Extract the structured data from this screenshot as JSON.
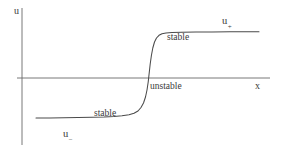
{
  "figure": {
    "background_color": "#ffffff",
    "line_color": "#4a4a4a",
    "text_color": "#3a3a3a"
  },
  "axes": {
    "y_label": "u",
    "x_label": "x",
    "y_axis": {
      "x": 22,
      "y_top": 8,
      "y_bottom": 145
    },
    "x_axis": {
      "y": 78,
      "x_left": 17,
      "x_right": 270
    },
    "ticks": [],
    "grid": false
  },
  "annotations": [
    {
      "id": "u-plus",
      "text": "u",
      "subscript": "+",
      "x": 222,
      "y": 16
    },
    {
      "id": "u-minus",
      "text": "u",
      "subscript": "−",
      "x": 63,
      "y": 129
    },
    {
      "id": "stable-upper",
      "text": "stable",
      "subscript": "",
      "x": 167,
      "y": 33
    },
    {
      "id": "unstable",
      "text": "unstable",
      "subscript": "",
      "x": 150,
      "y": 82
    },
    {
      "id": "stable-lower",
      "text": "stable",
      "subscript": "",
      "x": 94,
      "y": 109
    }
  ],
  "chart_data": {
    "type": "line",
    "title": "",
    "xlabel": "x",
    "ylabel": "u",
    "grid": false,
    "legend": null,
    "xlim": [
      17,
      270
    ],
    "ylim_pixels": [
      32,
      118
    ],
    "series": [
      {
        "name": "front profile u(x)",
        "stroke": "#4a4a4a",
        "points": [
          [
            36,
            118
          ],
          [
            50,
            118
          ],
          [
            64,
            117.8
          ],
          [
            78,
            117.6
          ],
          [
            92,
            117.3
          ],
          [
            104,
            117.0
          ],
          [
            114,
            116.5
          ],
          [
            122,
            115.8
          ],
          [
            129,
            114.8
          ],
          [
            134,
            113.3
          ],
          [
            138,
            111.0
          ],
          [
            141,
            107.5
          ],
          [
            143.5,
            103.0
          ],
          [
            145.5,
            97.0
          ],
          [
            147,
            90.0
          ],
          [
            148.2,
            82.0
          ],
          [
            149.2,
            73.0
          ],
          [
            150.2,
            64.0
          ],
          [
            151.4,
            55.5
          ],
          [
            152.8,
            48.0
          ],
          [
            154.5,
            42.0
          ],
          [
            156.5,
            38.0
          ],
          [
            159,
            35.3
          ],
          [
            162,
            33.8
          ],
          [
            166,
            33.0
          ],
          [
            172,
            32.5
          ],
          [
            182,
            32.2
          ],
          [
            196,
            32.0
          ],
          [
            212,
            31.9
          ],
          [
            230,
            31.8
          ],
          [
            245,
            31.8
          ],
          [
            259,
            31.8
          ]
        ]
      }
    ],
    "levels": {
      "u_plus_pixel_y": 32,
      "u_minus_pixel_y": 118,
      "unstable_pixel_y": 78
    }
  }
}
